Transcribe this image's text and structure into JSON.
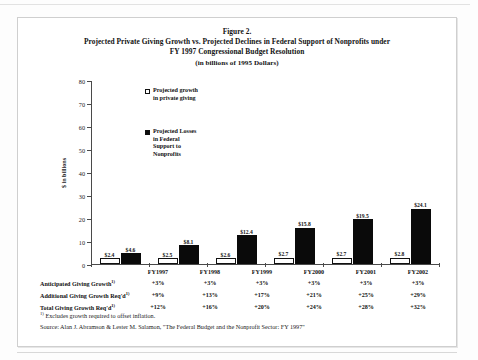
{
  "figure": {
    "label": "Figure 2.",
    "title_line1": "Projected Private Giving Growth vs. Projected Declines in Federal Support of Nonprofits under",
    "title_line2": "FY 1997 Congressional Budget Resolution",
    "subtitle": "(in billions of 1995 Dollars)"
  },
  "legend": {
    "items": [
      {
        "label": "Projected growth\nin private giving",
        "line1": "Projected growth",
        "line2": "in private giving",
        "marker": "open-square-icon",
        "color": "#ffffff"
      },
      {
        "label": "Projected Losses\nin Federal\nSupport to\nNonprofits",
        "line1": "Projected Losses",
        "line2": "in Federal",
        "line3": "Support to",
        "line4": "Nonprofits",
        "marker": "filled-square-icon",
        "color": "#0a0a0a"
      }
    ]
  },
  "axis": {
    "y_label": "$ in billions",
    "y_ticks": [
      "0",
      "10",
      "20",
      "30",
      "40",
      "50",
      "60",
      "70",
      "80"
    ],
    "y_min": 0,
    "y_max": 80
  },
  "chart_data": {
    "type": "bar",
    "title": "Projected Private Giving Growth vs. Projected Declines in Federal Support of Nonprofits under FY 1997 Congressional Budget Resolution",
    "subtitle": "(in billions of 1995 Dollars)",
    "xlabel": "",
    "ylabel": "$ in billions",
    "ylim": [
      0,
      80
    ],
    "grid": false,
    "legend_position": "inside-upper-left",
    "categories": [
      "FY1997",
      "FY1998",
      "FY1999",
      "FY2000",
      "FY2001",
      "FY2002"
    ],
    "series": [
      {
        "name": "Projected growth in private giving",
        "color": "#ffffff",
        "values": [
          2.4,
          2.5,
          2.6,
          2.7,
          2.7,
          2.8
        ],
        "data_labels": [
          "$2.4",
          "$2.5",
          "$2.6",
          "$2.7",
          "$2.7",
          "$2.8"
        ]
      },
      {
        "name": "Projected Losses in Federal Support to Nonprofits",
        "color": "#0a0a0a",
        "values": [
          4.6,
          8.1,
          12.4,
          15.8,
          19.5,
          24.1
        ],
        "data_labels": [
          "$4.6",
          "$8.1",
          "$12.4",
          "$15.8",
          "$19.5",
          "$24.1"
        ]
      }
    ],
    "table": {
      "row_labels": [
        "Anticipated Giving Growth",
        "Additional Giving Growth Req'd",
        "Total Giving Growth Req'd"
      ],
      "footnote_marker": "1)",
      "rows": [
        [
          "+3%",
          "+3%",
          "+3%",
          "+3%",
          "+3%",
          "+3%"
        ],
        [
          "+9%",
          "+13%",
          "+17%",
          "+21%",
          "+25%",
          "+29%"
        ],
        [
          "+12%",
          "+16%",
          "+20%",
          "+24%",
          "+28%",
          "+32%"
        ]
      ]
    }
  },
  "notes": {
    "footnote": "Excludes growth required to offset inflation.",
    "footnote_marker": "1)",
    "source": "Source:  Alan J. Abramson & Lester M. Salamon, \"The Federal Budget and the Nonprofit Sector: FY 1997\""
  }
}
